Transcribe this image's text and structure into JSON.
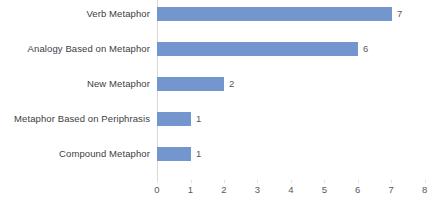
{
  "chart_data": {
    "type": "bar",
    "orientation": "horizontal",
    "title": "",
    "xlabel": "",
    "ylabel": "",
    "categories": [
      "Verb Metaphor",
      "Analogy Based on Metaphor",
      "New  Metaphor",
      "Metaphor Based on Periphrasis",
      "Compound  Metaphor"
    ],
    "values": [
      7,
      6,
      2,
      1,
      1
    ],
    "data_labels": [
      "7",
      "6",
      "2",
      "1",
      "1"
    ],
    "xlim": [
      0,
      8
    ],
    "xticks": [
      "0",
      "1",
      "2",
      "3",
      "4",
      "5",
      "6",
      "7",
      "8"
    ],
    "grid": false,
    "legend": false,
    "bar_color": "#7296cd",
    "label_color": "#404040",
    "tick_color": "#595959",
    "background": "#ffffff"
  }
}
